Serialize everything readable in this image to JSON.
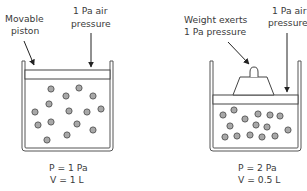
{
  "diagram": {
    "left_panel": {
      "label_piston": [
        "Movable",
        "piston"
      ],
      "label_air": [
        "1 Pa air",
        "pressure"
      ],
      "pressure_label": "P = 1 Pa",
      "volume_label": "V = 1 L",
      "particles": [
        [
          51,
          89
        ],
        [
          79,
          88
        ],
        [
          66,
          96
        ],
        [
          93,
          96
        ],
        [
          49,
          104
        ],
        [
          35,
          112
        ],
        [
          69,
          111
        ],
        [
          87,
          112
        ],
        [
          101,
          109
        ],
        [
          38,
          125
        ],
        [
          51,
          122
        ],
        [
          77,
          124
        ],
        [
          93,
          130
        ],
        [
          67,
          135
        ],
        [
          47,
          140
        ]
      ]
    },
    "right_panel": {
      "label_weight": [
        "Weight exerts",
        "1 Pa pressure"
      ],
      "label_air": [
        "1 Pa air",
        "pressure"
      ],
      "pressure_label": "P = 2 Pa",
      "volume_label": "V = 0.5 L",
      "particles": [
        [
          223,
          115
        ],
        [
          234,
          110
        ],
        [
          245,
          119
        ],
        [
          258,
          114
        ],
        [
          270,
          115
        ],
        [
          280,
          116
        ],
        [
          230,
          126
        ],
        [
          256,
          125
        ],
        [
          267,
          127
        ],
        [
          288,
          130
        ],
        [
          225,
          137
        ],
        [
          237,
          136
        ],
        [
          250,
          135
        ],
        [
          262,
          137
        ],
        [
          275,
          136
        ]
      ]
    },
    "colors": {
      "particle_fill": "#a8a8a8",
      "stroke": "#444444",
      "text": "#3a3a3a"
    }
  }
}
